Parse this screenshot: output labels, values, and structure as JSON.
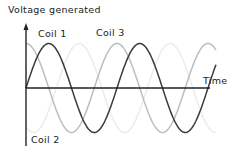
{
  "chart_data": {
    "type": "line",
    "title": "Voltage generated",
    "ylabel": "Voltage generated",
    "xlabel": "Time",
    "grid": false,
    "legend": "inline labels",
    "series": [
      {
        "name": "Coil 1",
        "phase_deg": 0,
        "color": "#3a3a3a",
        "shape": "sine"
      },
      {
        "name": "Coil 2",
        "phase_deg": -120,
        "color": "#ececec",
        "shape": "sine"
      },
      {
        "name": "Coil 3",
        "phase_deg": 90,
        "color": "#bdbdbd",
        "shape": "sine"
      }
    ],
    "cycles_shown": 2
  },
  "labels": {
    "y_axis": "Voltage generated",
    "x_axis": "Time",
    "coil1": "Coil 1",
    "coil2": "Coil 2",
    "coil3": "Coil 3"
  }
}
